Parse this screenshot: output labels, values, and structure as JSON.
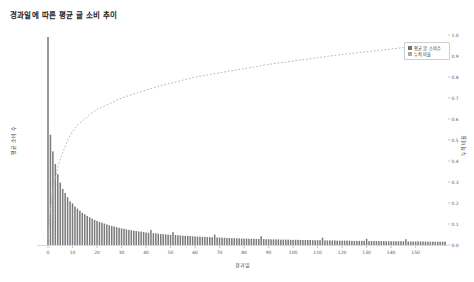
{
  "title": "경과일에 따른 평균 글 소비 추이",
  "axes": {
    "xlabel": "경과일",
    "ylabel_left": "평균 소비 수",
    "ylabel_right": "누적 비율",
    "x_ticks": [
      0,
      10,
      20,
      30,
      40,
      50,
      60,
      70,
      80,
      90,
      100,
      110,
      120,
      130,
      140,
      150
    ],
    "y_right_ticks": [
      "0.0",
      "0.1",
      "0.2",
      "0.3",
      "0.4",
      "0.5",
      "0.6",
      "0.7",
      "0.8",
      "0.9",
      "1.0"
    ]
  },
  "legend": {
    "items": [
      {
        "label": "평균 글 소비수",
        "color": "#6f6f6f",
        "marker": "square"
      },
      {
        "label": "누적 비율",
        "color": "#a8a8a8",
        "marker": "square"
      }
    ]
  },
  "colors": {
    "bar": "#7a7a7a",
    "line": "#b2b2b2",
    "axis": "#c8c8c8",
    "tick_text": "#5a5a5a"
  },
  "chart_data": {
    "type": "bar",
    "title": "경과일에 따른 평균 글 소비 추이",
    "xlabel": "경과일",
    "ylabel": "평균 소비 수",
    "ylabel_right": "누적 비율",
    "xlim": [
      -4,
      167
    ],
    "ylim_right": [
      0.0,
      1.0
    ],
    "grid": false,
    "legend_position": "upper right",
    "x_is_days": true,
    "series": [
      {
        "name": "평균 글 소비수",
        "type": "bar",
        "axis": "left",
        "note": "normalized average posts consumed per elapsed day, day0 = max",
        "values": [
          1.0,
          0.53,
          0.45,
          0.39,
          0.34,
          0.3,
          0.27,
          0.25,
          0.23,
          0.21,
          0.2,
          0.185,
          0.175,
          0.165,
          0.155,
          0.148,
          0.14,
          0.133,
          0.127,
          0.121,
          0.116,
          0.111,
          0.107,
          0.103,
          0.099,
          0.095,
          0.092,
          0.089,
          0.086,
          0.083,
          0.08,
          0.078,
          0.075,
          0.073,
          0.071,
          0.069,
          0.067,
          0.065,
          0.064,
          0.062,
          0.06,
          0.059,
          0.072,
          0.057,
          0.056,
          0.055,
          0.053,
          0.052,
          0.051,
          0.05,
          0.049,
          0.062,
          0.048,
          0.047,
          0.046,
          0.045,
          0.044,
          0.044,
          0.043,
          0.042,
          0.041,
          0.041,
          0.04,
          0.039,
          0.039,
          0.038,
          0.038,
          0.037,
          0.05,
          0.036,
          0.036,
          0.035,
          0.035,
          0.034,
          0.034,
          0.033,
          0.033,
          0.032,
          0.032,
          0.031,
          0.031,
          0.031,
          0.03,
          0.03,
          0.03,
          0.029,
          0.029,
          0.042,
          0.028,
          0.028,
          0.028,
          0.027,
          0.027,
          0.027,
          0.027,
          0.026,
          0.026,
          0.026,
          0.026,
          0.025,
          0.025,
          0.025,
          0.025,
          0.024,
          0.024,
          0.024,
          0.024,
          0.024,
          0.023,
          0.023,
          0.023,
          0.023,
          0.035,
          0.022,
          0.022,
          0.022,
          0.022,
          0.022,
          0.021,
          0.021,
          0.021,
          0.021,
          0.021,
          0.021,
          0.02,
          0.02,
          0.02,
          0.02,
          0.02,
          0.02,
          0.03,
          0.019,
          0.019,
          0.019,
          0.019,
          0.019,
          0.019,
          0.019,
          0.018,
          0.018,
          0.018,
          0.018,
          0.018,
          0.018,
          0.018,
          0.018,
          0.028,
          0.017,
          0.017,
          0.017,
          0.017,
          0.017,
          0.017,
          0.017,
          0.017,
          0.016,
          0.016,
          0.016,
          0.016,
          0.016,
          0.016,
          0.016,
          0.016
        ]
      },
      {
        "name": "누적 비율",
        "type": "line",
        "style": "dashed",
        "axis": "right",
        "points": [
          [
            0,
            0.03
          ],
          [
            1,
            0.17
          ],
          [
            2,
            0.26
          ],
          [
            3,
            0.32
          ],
          [
            4,
            0.37
          ],
          [
            5,
            0.41
          ],
          [
            6,
            0.44
          ],
          [
            7,
            0.47
          ],
          [
            8,
            0.5
          ],
          [
            9,
            0.52
          ],
          [
            10,
            0.54
          ],
          [
            12,
            0.57
          ],
          [
            14,
            0.59
          ],
          [
            16,
            0.61
          ],
          [
            18,
            0.63
          ],
          [
            20,
            0.645
          ],
          [
            23,
            0.662
          ],
          [
            26,
            0.678
          ],
          [
            30,
            0.7
          ],
          [
            34,
            0.715
          ],
          [
            38,
            0.73
          ],
          [
            42,
            0.745
          ],
          [
            46,
            0.758
          ],
          [
            50,
            0.77
          ],
          [
            55,
            0.785
          ],
          [
            60,
            0.8
          ],
          [
            65,
            0.81
          ],
          [
            70,
            0.82
          ],
          [
            75,
            0.83
          ],
          [
            80,
            0.84
          ],
          [
            85,
            0.85
          ],
          [
            90,
            0.86
          ],
          [
            95,
            0.868
          ],
          [
            100,
            0.876
          ],
          [
            105,
            0.884
          ],
          [
            110,
            0.892
          ],
          [
            115,
            0.9
          ],
          [
            120,
            0.907
          ],
          [
            125,
            0.914
          ],
          [
            130,
            0.92
          ],
          [
            135,
            0.927
          ],
          [
            140,
            0.933
          ],
          [
            145,
            0.94
          ],
          [
            150,
            0.946
          ],
          [
            155,
            0.952
          ],
          [
            158,
            0.955
          ],
          [
            160,
            0.957
          ],
          [
            162,
            0.958
          ]
        ]
      }
    ]
  }
}
